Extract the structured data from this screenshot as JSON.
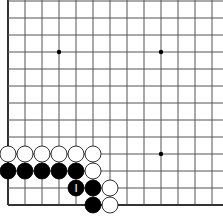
{
  "board": {
    "description": "Go board corner fragment (lower-left corner visible)",
    "grid_origin_x": 8,
    "grid_bottom_y": 205,
    "spacing": 17,
    "columns": 13,
    "rows": 13,
    "line_color": "#555555",
    "edge_color": "#333333",
    "background": "#ffffff",
    "star_points": [
      {
        "col": 3,
        "row": 9
      },
      {
        "col": 9,
        "row": 9
      },
      {
        "col": 9,
        "row": 3
      }
    ],
    "stones": [
      {
        "color": "white",
        "col": 0,
        "row": 3
      },
      {
        "color": "white",
        "col": 1,
        "row": 3
      },
      {
        "color": "white",
        "col": 2,
        "row": 3
      },
      {
        "color": "white",
        "col": 3,
        "row": 3
      },
      {
        "color": "white",
        "col": 4,
        "row": 3
      },
      {
        "color": "white",
        "col": 5,
        "row": 3
      },
      {
        "color": "black",
        "col": 0,
        "row": 2
      },
      {
        "color": "black",
        "col": 1,
        "row": 2
      },
      {
        "color": "black",
        "col": 2,
        "row": 2
      },
      {
        "color": "black",
        "col": 3,
        "row": 2
      },
      {
        "color": "black",
        "col": 4,
        "row": 2
      },
      {
        "color": "white",
        "col": 5,
        "row": 2
      },
      {
        "color": "black",
        "col": 4,
        "row": 1,
        "label": "I"
      },
      {
        "color": "black",
        "col": 5,
        "row": 1
      },
      {
        "color": "white",
        "col": 6,
        "row": 1
      },
      {
        "color": "black",
        "col": 5,
        "row": 0
      },
      {
        "color": "white",
        "col": 6,
        "row": 0
      }
    ]
  }
}
